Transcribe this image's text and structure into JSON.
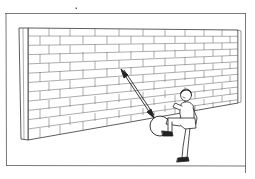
{
  "illustration": {
    "caption": "Boy kicking a ball against a brick wall; double-headed arrow shows ball path to and from the wall",
    "elements": {
      "frame": "rectangular border",
      "wall": "brick wall in perspective",
      "arrow": "double-headed arrow",
      "ball": "ball",
      "person": "boy kicking with raised knee"
    },
    "colors": {
      "line": "#333333",
      "mortar": "#777777",
      "background": "#ffffff"
    }
  }
}
